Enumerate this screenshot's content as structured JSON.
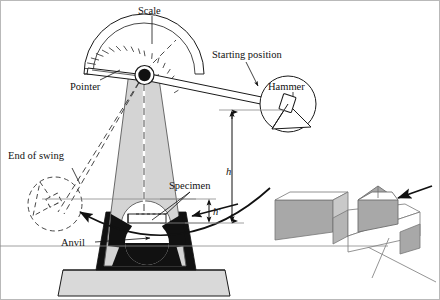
{
  "figure": {
    "background_color": "#ffffff",
    "border_color": "#b9b9b9"
  },
  "labels": {
    "scale": "Scale",
    "pointer": "Pointer",
    "starting_position": "Starting position",
    "hammer": "Hammer",
    "end_of_swing": "End of swing",
    "specimen": "Specimen",
    "anvil": "Anvil",
    "height_h": "h",
    "height_h_prime": "h'"
  },
  "colors": {
    "line": "#1a1a1a",
    "column_fill": "#d4d4d4",
    "base_fill": "#d9d9d9",
    "anvil_fill": "#111111",
    "specimen_fill": "#a8a8a8",
    "specimen_face": "#c9c9c9",
    "dashed": "#3a3a3a",
    "thin_rule": "#888888"
  },
  "parts": {
    "scale_ticks_count": 19,
    "pivot_label": "pivot",
    "hammer_shape": "disc-with-notch",
    "end_of_swing_style": "dashed-outline",
    "inset": {
      "name": "notched-specimen-detail",
      "striker_label": "striking-edge",
      "notch_label": "v-notch"
    }
  }
}
